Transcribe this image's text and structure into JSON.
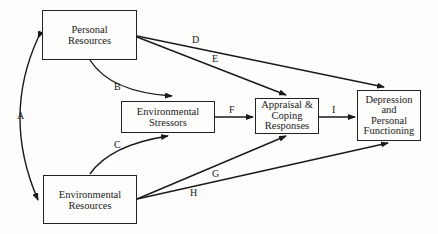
{
  "nodes": {
    "personal": {
      "lines": [
        "Personal",
        "Resources"
      ]
    },
    "stressors": {
      "lines": [
        "Environmental",
        "Stressors"
      ]
    },
    "appraisal": {
      "lines": [
        "Appraisal &",
        "Coping",
        "Responses"
      ]
    },
    "depression": {
      "lines": [
        "Depression",
        "and",
        "Personal",
        "Functioning"
      ]
    },
    "envres": {
      "lines": [
        "Environmental",
        "Resources"
      ]
    }
  },
  "paths": {
    "A": "A",
    "B": "B",
    "C": "C",
    "D": "D",
    "E": "E",
    "F": "F",
    "G": "G",
    "H": "H",
    "I": "I"
  }
}
